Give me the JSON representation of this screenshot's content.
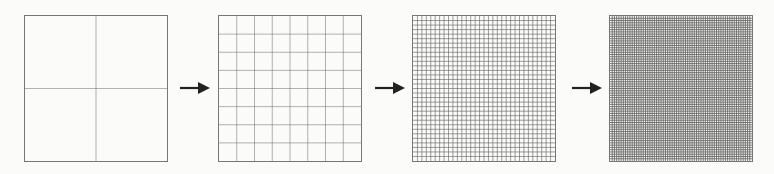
{
  "diagram": {
    "panels": [
      {
        "id": "grid-2x2",
        "divisions": 2,
        "left": 24
      },
      {
        "id": "grid-8x8",
        "divisions": 8,
        "left": 218
      },
      {
        "id": "grid-32x32",
        "divisions": 32,
        "left": 412
      },
      {
        "id": "grid-64x64",
        "divisions": 64,
        "left": 609
      }
    ],
    "arrows": [
      {
        "from": "grid-2x2",
        "to": "grid-8x8",
        "left": 180
      },
      {
        "from": "grid-8x8",
        "to": "grid-32x32",
        "left": 375
      },
      {
        "from": "grid-32x32",
        "to": "grid-64x64",
        "left": 572
      }
    ],
    "colors": {
      "line": "#666666",
      "arrow": "#222222",
      "background": "#fbfbf9"
    }
  }
}
